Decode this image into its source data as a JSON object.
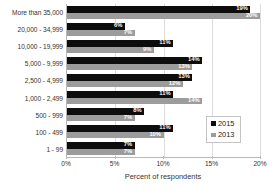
{
  "chart_data": {
    "type": "bar",
    "orientation": "horizontal",
    "title": "",
    "xlabel": "Percent of respondents",
    "ylabel": "",
    "xlim": [
      0,
      20
    ],
    "xticks": [
      "0%",
      "5%",
      "10%",
      "15%",
      "20%"
    ],
    "xtick_values": [
      0,
      5,
      10,
      15,
      20
    ],
    "grid": true,
    "legend_position": "center-right",
    "categories": [
      "More than 35,000",
      "20,000 - 34,999",
      "10,000 - 19,999",
      "5,000 - 9,999",
      "2,500 - 4,999",
      "1,000 - 2,499",
      "500 - 999",
      "100 - 499",
      "1 - 99"
    ],
    "series": [
      {
        "name": "2015",
        "color": "#0d0d0d",
        "values": [
          19,
          6,
          11,
          14,
          13,
          11,
          8,
          11,
          7
        ],
        "labels": [
          "19%",
          "6%",
          "11%",
          "14%",
          "13%",
          "11%",
          "8%",
          "11%",
          "7%"
        ]
      },
      {
        "name": "2013",
        "color": "#9c9c9c",
        "values": [
          20,
          7,
          9,
          13,
          12,
          14,
          7,
          10,
          7
        ],
        "labels": [
          "20%",
          "7%",
          "9%",
          "13%",
          "12%",
          "14%",
          "7%",
          "10%",
          "7%"
        ]
      }
    ]
  },
  "legend": {
    "items": [
      {
        "label": "2015",
        "color": "#0d0d0d"
      },
      {
        "label": "2013",
        "color": "#9c9c9c"
      }
    ]
  }
}
